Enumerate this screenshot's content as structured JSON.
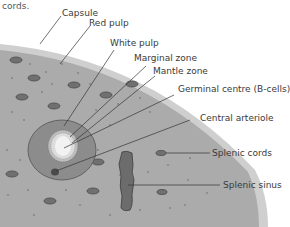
{
  "caption_fragment": "cords.",
  "diagram": {
    "colors": {
      "capsule": "#c8c8c8",
      "red_pulp": "#a9a9a9",
      "white_pulp": "#8a8a8a",
      "marginal_zone": "#b8b8b8",
      "mantle_zone": "#d8d8d8",
      "germinal_centre": "#f0f0f0",
      "arteriole": "#4a4a4a",
      "cords": "#6e6e6e",
      "sinus": "#6a6a6a",
      "leader": "#333333"
    },
    "labels": [
      {
        "id": "capsule",
        "text": "Capsule"
      },
      {
        "id": "red-pulp",
        "text": "Red pulp"
      },
      {
        "id": "white-pulp",
        "text": "White pulp"
      },
      {
        "id": "marginal-zone",
        "text": "Marginal zone"
      },
      {
        "id": "mantle-zone",
        "text": "Mantle zone"
      },
      {
        "id": "germinal-centre",
        "text": "Germinal centre (B-cells)"
      },
      {
        "id": "central-arteriole",
        "text": "Central arteriole"
      },
      {
        "id": "splenic-cords",
        "text": "Splenic cords"
      },
      {
        "id": "splenic-sinus",
        "text": "Splenic sinus"
      }
    ]
  }
}
